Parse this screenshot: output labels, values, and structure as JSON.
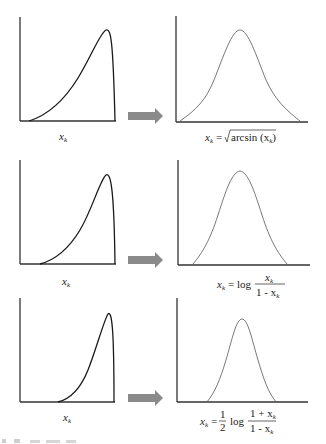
{
  "figure": {
    "panels": [
      {
        "input_label": "x",
        "input_label_sub": "k",
        "transform": {
          "lhs": "x",
          "lhs_sub": "k",
          "eq": "=",
          "func": "arcsin (x",
          "func_sub": "k",
          "close": ")",
          "kind": "sqrt-arcsin"
        }
      },
      {
        "input_label": "x",
        "input_label_sub": "k",
        "transform": {
          "lhs": "x",
          "lhs_sub": "k",
          "eq": "= log",
          "num": "x",
          "num_sub": "k",
          "den": "1 - x",
          "den_sub": "k",
          "kind": "logit"
        }
      },
      {
        "input_label": "x",
        "input_label_sub": "k",
        "transform": {
          "lhs": "x",
          "lhs_sub": "k",
          "eq": "=",
          "coef_num": "1",
          "coef_den": "2",
          "log": "log",
          "num": "1 + x",
          "num_sub": "k",
          "den": "1 - x",
          "den_sub": "k",
          "kind": "fisher-z"
        }
      }
    ],
    "footer_fragment": "(illegible cropped text)"
  },
  "colors": {
    "axis": "#333333",
    "skewed_curve": "#1a1a1a",
    "bell_curve": "#555555",
    "arrow": "#8a8a8a"
  }
}
